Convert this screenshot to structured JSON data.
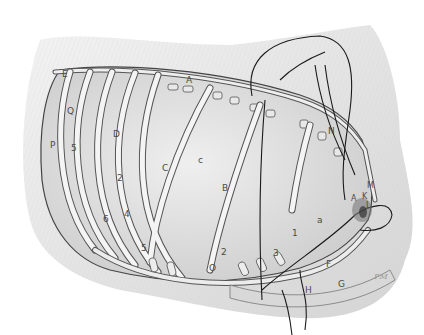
{
  "figure": {
    "signature": "PM",
    "labels": [
      {
        "id": "E",
        "text": "E",
        "x": 62,
        "y": 75
      },
      {
        "id": "A-top",
        "text": "A",
        "x": 186,
        "y": 80
      },
      {
        "id": "N",
        "text": "N",
        "x": 328,
        "y": 131
      },
      {
        "id": "Q-left",
        "text": "Q",
        "x": 67,
        "y": 112
      },
      {
        "id": "D",
        "text": "D",
        "x": 113,
        "y": 134
      },
      {
        "id": "P",
        "text": "P",
        "x": 50,
        "y": 145
      },
      {
        "id": "5-upper",
        "text": "5",
        "x": 71,
        "y": 148
      },
      {
        "id": "c",
        "text": "c",
        "x": 198,
        "y": 160
      },
      {
        "id": "C",
        "text": "C",
        "x": 162,
        "y": 168
      },
      {
        "id": "B",
        "text": "B",
        "x": 222,
        "y": 188
      },
      {
        "id": "2-left",
        "text": "2",
        "x": 117,
        "y": 178
      },
      {
        "id": "6",
        "text": "6",
        "x": 103,
        "y": 219
      },
      {
        "id": "4",
        "text": "4",
        "x": 124,
        "y": 214
      },
      {
        "id": "5-lower",
        "text": "5",
        "x": 141,
        "y": 248
      },
      {
        "id": "a",
        "text": "a",
        "x": 317,
        "y": 220
      },
      {
        "id": "2-right",
        "text": "2",
        "x": 221,
        "y": 252
      },
      {
        "id": "O",
        "text": "O",
        "x": 209,
        "y": 268
      },
      {
        "id": "3",
        "text": "3",
        "x": 273,
        "y": 253
      },
      {
        "id": "1",
        "text": "1",
        "x": 292,
        "y": 233
      },
      {
        "id": "F",
        "text": "F",
        "x": 326,
        "y": 264
      },
      {
        "id": "H",
        "text": "H",
        "x": 305,
        "y": 290
      },
      {
        "id": "G",
        "text": "G",
        "x": 338,
        "y": 284
      },
      {
        "id": "A-right",
        "text": "A",
        "x": 351,
        "y": 199
      },
      {
        "id": "K",
        "text": "K",
        "x": 362,
        "y": 197
      },
      {
        "id": "M",
        "text": "M",
        "x": 367,
        "y": 186
      },
      {
        "id": "L",
        "text": "L",
        "x": 366,
        "y": 206
      }
    ],
    "colors": {
      "background": "#ffffff",
      "fur_shading": "#d9d9d9",
      "cavity_fill": "#e4e4e4",
      "rib_fill": "#f2f2f2",
      "rib_stroke": "#555555",
      "outline": "#222222",
      "deep_shadow": "#8a8a8a"
    }
  }
}
